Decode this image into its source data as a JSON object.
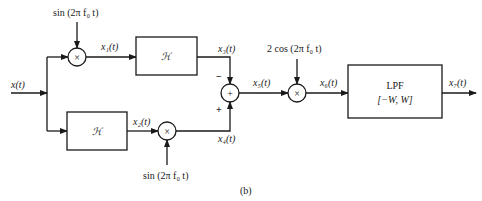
{
  "diagram": {
    "caption": "(b)",
    "input": {
      "label": "x(t)"
    },
    "signals": {
      "x1": "x₁(t)",
      "x2": "x₂(t)",
      "x3": "x₃(t)",
      "x4": "x₄(t)",
      "x5": "x₅(t)",
      "x6": "x₆(t)",
      "x7": "x₇(t)"
    },
    "carriers": {
      "top_sin": "sin (2π f₀ t)",
      "bottom_sin": "sin (2π f₀ t)",
      "cos": "2 cos (2π f₀ t)"
    },
    "blocks": {
      "hilbert_top": "ℋ",
      "hilbert_bottom": "ℋ",
      "lpf_line1": "LPF",
      "lpf_line2": "[−W, W]"
    },
    "operators": {
      "multiply": "×",
      "sum": "+"
    },
    "summer_signs": {
      "top": "−",
      "bottom": "+"
    }
  }
}
